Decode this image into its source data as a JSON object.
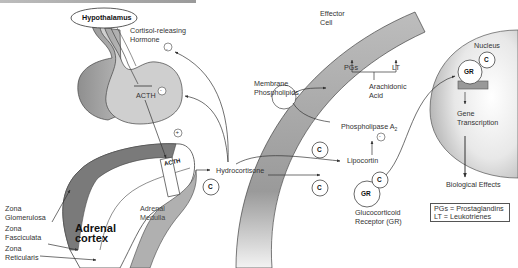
{
  "figure": {
    "labels": {
      "hypothalamus": "Hypothalamus",
      "crh": "Cortisol-releasing\nHormone",
      "crh_line1": "Cortisol-releasing",
      "crh_line2": "Hormone",
      "acth_pituitary": "ACTH",
      "acth_adrenal": "ACTH",
      "plus_sign": "+",
      "minus_sign": "-",
      "zona_glomerulosa_1": "Zona",
      "zona_glomerulosa_2": "Glomerulosa",
      "zona_fasciculata_1": "Zona",
      "zona_fasciculata_2": "Fasciculata",
      "zona_reticularis_1": "Zona",
      "zona_reticularis_2": "Reticularis",
      "adrenal_cortex_1": "Adrenal",
      "adrenal_cortex_2": "cortex",
      "adrenal_medulla_1": "Adrenal",
      "adrenal_medulla_2": "Medulla",
      "hydrocortisone": "Hydrocortisone",
      "cortisol_symbol": "C",
      "effector_cell_1": "Effector",
      "effector_cell_2": "Cell",
      "membrane_phospholipids_1": "Membrane",
      "membrane_phospholipids_2": "Phospholipids",
      "pgs": "PGs",
      "lt": "LT",
      "arachidonic_acid_1": "Arachidonic",
      "arachidonic_acid_2": "Acid",
      "phospholipase": "Phospholipase A",
      "phospholipase_sub": "2",
      "lipocortin": "Lipocortin",
      "gr": "GR",
      "gr_label_1": "Glucocorticoid",
      "gr_label_2": "Receptor (GR)",
      "nucleus": "Nucleus",
      "gene_transcription_1": "Gene",
      "gene_transcription_2": "Transcription",
      "biological_effects": "Biological Effects"
    },
    "legend": [
      {
        "abbr": "PGs",
        "text": "PGs = Prostaglandins"
      },
      {
        "abbr": "LT",
        "text": "LT = Leukotrienes"
      }
    ],
    "colors": {
      "dark_gray": "#7a7a7a",
      "mid_gray": "#a8a8a8",
      "light_gray": "#cfcfcf",
      "membrane_gray": "#9e9e9e",
      "line": "#444444"
    }
  }
}
